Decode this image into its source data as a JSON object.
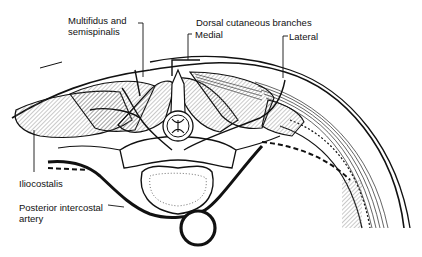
{
  "diagram": {
    "type": "anatomical cross-section",
    "colors": {
      "ink": "#111111",
      "background": "#ffffff",
      "hatch": "#555555"
    }
  },
  "labels": {
    "multifidus_line1": "Multifidus and",
    "multifidus_line2": "semispinalis",
    "dorsal_cutaneous": "Dorsal cutaneous branches",
    "medial": "Medial",
    "lateral": "Lateral",
    "iliocostalis": "Iliocostalis",
    "posterior_intercostal_line1": "Posterior intercostal",
    "posterior_intercostal_line2": "artery"
  }
}
